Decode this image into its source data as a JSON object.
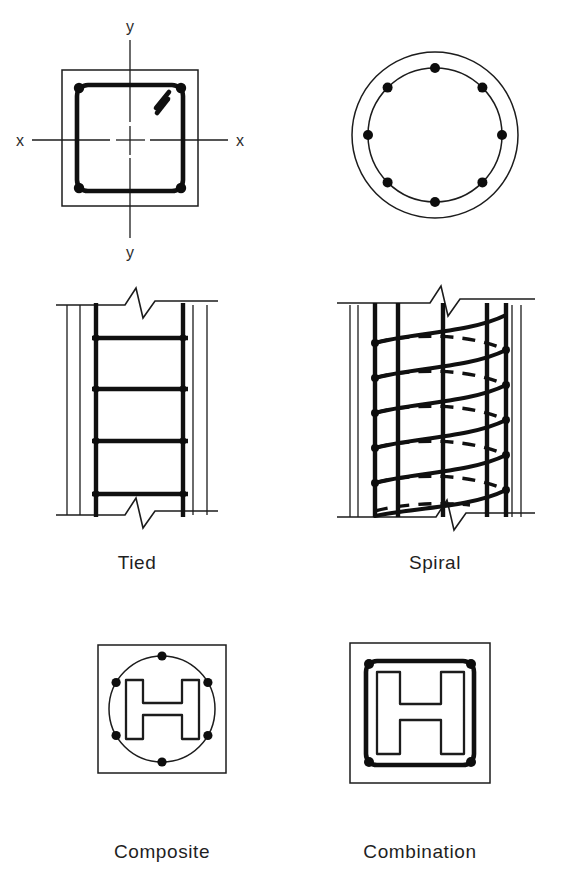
{
  "sheet": {
    "title": "Reinforced concrete column types",
    "background_color": "#ffffff",
    "line_color": "#1c1c1c",
    "rebar_color": "#0d0d0d"
  },
  "figures": [
    {
      "id": "tied-section",
      "kind": "cross-section",
      "caption": "",
      "axis_labels": {
        "x_left": "x",
        "x_right": "x",
        "y_top": "y",
        "y_bottom": "y"
      },
      "shape": "square",
      "rebar_count": 4,
      "tie_hook": "135-degree-hook"
    },
    {
      "id": "spiral-section",
      "kind": "cross-section",
      "caption": "",
      "shape": "circle",
      "rebar_count": 8
    },
    {
      "id": "tied-elevation",
      "kind": "elevation",
      "caption": "Tied",
      "vertical_bars": 2,
      "tie_count": 4
    },
    {
      "id": "spiral-elevation",
      "kind": "elevation",
      "caption": "Spiral",
      "vertical_bars": 5,
      "spiral_turns": 6
    },
    {
      "id": "composite-section",
      "kind": "cross-section",
      "caption": "Composite",
      "shape": "square-with-circle",
      "rebar_count": 6,
      "steel_core": "H-section"
    },
    {
      "id": "combination-section",
      "kind": "cross-section",
      "caption": "Combination",
      "shape": "square-with-tie",
      "rebar_count": 4,
      "steel_core": "H-section"
    }
  ],
  "labels": {
    "tied": "Tied",
    "spiral": "Spiral",
    "composite": "Composite",
    "combination": "Combination",
    "axis_x_left": "x",
    "axis_x_right": "x",
    "axis_y_top": "y",
    "axis_y_bottom": "y"
  }
}
